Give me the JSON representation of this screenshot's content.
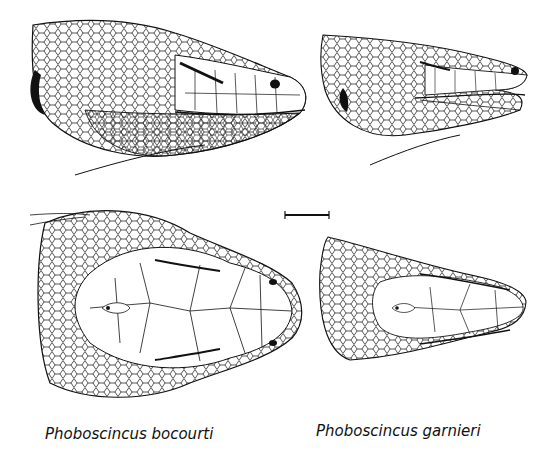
{
  "figure": {
    "panels": [
      {
        "id": "bocourti-lateral",
        "species": "Phoboscincus bocourti",
        "view": "lateral"
      },
      {
        "id": "garnieri-lateral",
        "species": "Phoboscincus garnieri",
        "view": "lateral"
      },
      {
        "id": "bocourti-dorsal",
        "species": "Phoboscincus bocourti",
        "view": "dorsal"
      },
      {
        "id": "garnieri-dorsal",
        "species": "Phoboscincus garnieri",
        "view": "dorsal"
      }
    ],
    "captions": {
      "left": "Phoboscincus bocourti",
      "right": "Phoboscincus garnieri"
    },
    "scale_bar": {
      "label": ""
    },
    "colors": {
      "ink": "#111111",
      "background": "#ffffff"
    }
  }
}
